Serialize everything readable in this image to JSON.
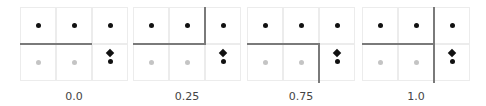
{
  "colors": {
    "grid_line": "#ececec",
    "partition_line": "#7a7a7a",
    "dot_active": "#111111",
    "dot_inactive": "#c4c4c4",
    "label_text": "#444444"
  },
  "grid": {
    "rows": 2,
    "cols": 3
  },
  "cell_markers": {
    "row0": [
      "black-dot",
      "black-dot",
      "black-dot"
    ],
    "row1": [
      "gray-dot",
      "gray-dot",
      "diamond+black-dot"
    ]
  },
  "panels": [
    {
      "label": "0.0",
      "partition": "horizontal line under top-left two cells"
    },
    {
      "label": "0.25",
      "partition": "horizontal line under top-left two cells, vertical line up to top"
    },
    {
      "label": "0.75",
      "partition": "horizontal line under top-left two cells, vertical line down to bottom"
    },
    {
      "label": "1.0",
      "partition": "horizontal line under top-left two cells, vertical line full height"
    }
  ]
}
